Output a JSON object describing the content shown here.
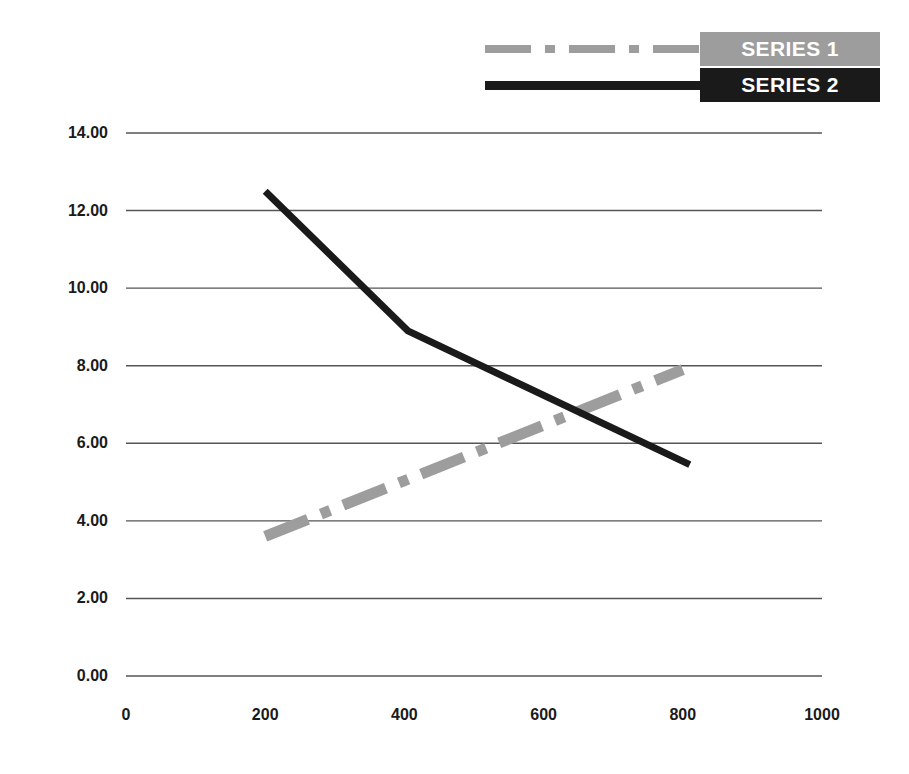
{
  "chart_data": {
    "type": "line",
    "title": "",
    "xlabel": "",
    "ylabel": "",
    "xlim": [
      0,
      1000
    ],
    "ylim": [
      0,
      14
    ],
    "grid": true,
    "legend_position": "top-right",
    "y_ticks": [
      "14.00",
      "12.00",
      "10.00",
      "8.00",
      "6.00",
      "4.00",
      "2.00",
      "0.00"
    ],
    "y_tick_values": [
      14,
      12,
      10,
      8,
      6,
      4,
      2,
      0
    ],
    "x_ticks": [
      "0",
      "200",
      "400",
      "600",
      "800",
      "1000"
    ],
    "x_tick_values": [
      0,
      200,
      400,
      600,
      800,
      1000
    ],
    "series": [
      {
        "name": "SERIES 1",
        "color": "#9d9d9d",
        "style": "dash-dot",
        "x": [
          200,
          800
        ],
        "values": [
          3.6,
          7.9
        ]
      },
      {
        "name": "SERIES 2",
        "color": "#1a1a1a",
        "style": "solid",
        "x": [
          200,
          405,
          810
        ],
        "values": [
          12.5,
          8.9,
          5.45
        ]
      }
    ]
  },
  "legend": {
    "items": [
      {
        "label": "SERIES 1",
        "swatch": "dash-dot-gray",
        "background": "#9d9d9d"
      },
      {
        "label": "SERIES 2",
        "swatch": "solid-black",
        "background": "#1a1a1a"
      }
    ]
  }
}
